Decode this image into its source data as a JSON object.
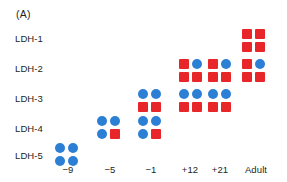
{
  "figure": {
    "panel_label": "(A)",
    "colors": {
      "m_subunit_blue": "#2b7fd4",
      "h_subunit_red": "#e8262a",
      "text": "#231f20",
      "background": "#ffffff"
    }
  },
  "rows": [
    {
      "label": "LDH-1"
    },
    {
      "label": "LDH-2"
    },
    {
      "label": "LDH-3"
    },
    {
      "label": "LDH-4"
    },
    {
      "label": "LDH-5"
    }
  ],
  "columns": [
    {
      "label": "−9"
    },
    {
      "label": "−5"
    },
    {
      "label": "−1"
    },
    {
      "label": "+12"
    },
    {
      "label": "+21"
    },
    {
      "label": "Adult"
    }
  ],
  "cells": [
    {
      "row": "LDH-1",
      "column": "Adult",
      "subunits": [
        "H",
        "H",
        "H",
        "H"
      ]
    },
    {
      "row": "LDH-2",
      "column": "+12",
      "subunits": [
        "H",
        "M",
        "H",
        "H"
      ]
    },
    {
      "row": "LDH-2",
      "column": "+21",
      "subunits": [
        "H",
        "M",
        "H",
        "H"
      ]
    },
    {
      "row": "LDH-2",
      "column": "Adult",
      "subunits": [
        "H",
        "M",
        "H",
        "H"
      ]
    },
    {
      "row": "LDH-3",
      "column": "−1",
      "subunits": [
        "M",
        "M",
        "H",
        "H"
      ]
    },
    {
      "row": "LDH-3",
      "column": "+12",
      "subunits": [
        "M",
        "M",
        "H",
        "H"
      ]
    },
    {
      "row": "LDH-3",
      "column": "+21",
      "subunits": [
        "M",
        "M",
        "H",
        "H"
      ]
    },
    {
      "row": "LDH-4",
      "column": "−5",
      "subunits": [
        "M",
        "M",
        "M",
        "H"
      ]
    },
    {
      "row": "LDH-4",
      "column": "−1",
      "subunits": [
        "M",
        "M",
        "M",
        "H"
      ]
    },
    {
      "row": "LDH-5",
      "column": "−9",
      "subunits": [
        "M",
        "M",
        "M",
        "M"
      ]
    }
  ],
  "layout": {
    "row_label_tops": [
      33,
      63,
      93,
      123,
      150
    ],
    "row_cell_tops": [
      27,
      57,
      87,
      114,
      141
    ],
    "column_lefts": [
      53,
      95,
      136,
      177,
      206,
      240
    ],
    "column_label_lefts": [
      46,
      88,
      129,
      168,
      198,
      234
    ]
  }
}
